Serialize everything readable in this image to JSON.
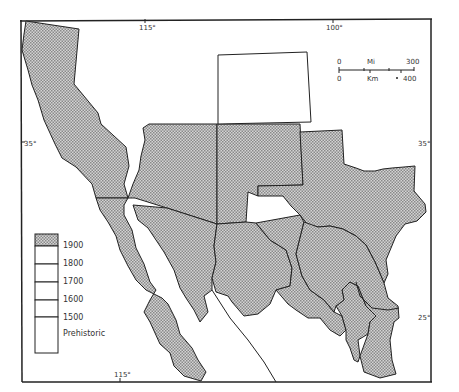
{
  "map": {
    "title": "",
    "graticule": {
      "top_ticks": [
        "115°",
        "100°"
      ],
      "bottom_ticks": [
        "115°"
      ],
      "left_ticks": [
        "35°"
      ],
      "right_ticks": [
        "35°",
        "25°"
      ]
    },
    "scale_bar": {
      "mi_label": "Mi",
      "km_label": "Km",
      "mi_start": "0",
      "mi_end": "300",
      "km_start": "0",
      "km_end": "400"
    },
    "legend": {
      "items": [
        {
          "label": "1900",
          "filled": true
        },
        {
          "label": "1800",
          "filled": false
        },
        {
          "label": "1700",
          "filled": false
        },
        {
          "label": "1600",
          "filled": false
        },
        {
          "label": "1500",
          "filled": false
        },
        {
          "label": "Prehistoric",
          "filled": false
        }
      ]
    },
    "colors": {
      "hatch_dark": "#8a8a8a",
      "hatch_light": "#d8d8d8",
      "line": "#222222",
      "background": "#ffffff"
    },
    "regions": [
      {
        "name": "California",
        "period": "1900"
      },
      {
        "name": "Arizona",
        "period": "1900"
      },
      {
        "name": "New Mexico",
        "period": "1900"
      },
      {
        "name": "Colorado",
        "period": "unshaded"
      },
      {
        "name": "Texas",
        "period": "1900"
      },
      {
        "name": "Baja California",
        "period": "1900"
      },
      {
        "name": "Sonora",
        "period": "1900"
      },
      {
        "name": "Chihuahua",
        "period": "1900"
      },
      {
        "name": "Coahuila",
        "period": "1900"
      },
      {
        "name": "Nuevo Leon",
        "period": "1900"
      },
      {
        "name": "Tamaulipas",
        "period": "1900"
      }
    ]
  }
}
